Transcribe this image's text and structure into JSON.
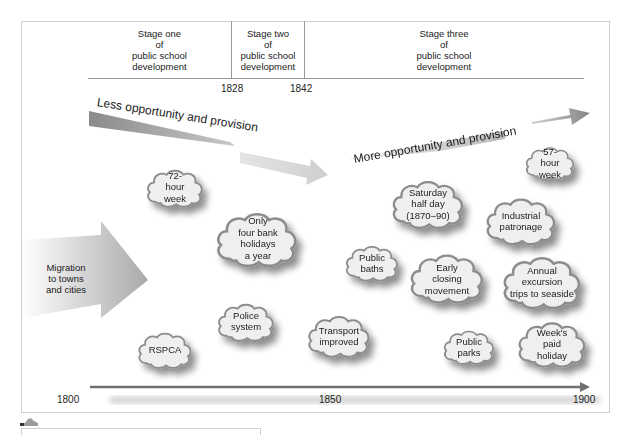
{
  "stages": [
    {
      "label": "Stage one of public school development",
      "lines": [
        "Stage one",
        "of",
        "public school",
        "development"
      ]
    },
    {
      "label": "Stage two of public school development",
      "lines": [
        "Stage two",
        "of",
        "public school",
        "development"
      ]
    },
    {
      "label": "Stage three of public school development",
      "lines": [
        "Stage three",
        "of",
        "public school",
        "development"
      ]
    }
  ],
  "stage_boundaries": [
    "1828",
    "1842"
  ],
  "trend_labels": {
    "less": "Less opportunity and provision",
    "more": "More opportunity and provision"
  },
  "migration": {
    "lines": [
      "Migration",
      "to towns",
      "and cities"
    ]
  },
  "clouds": [
    {
      "id": "72-hour-week",
      "lines": [
        "72-",
        "hour",
        "week"
      ]
    },
    {
      "id": "only-four-bank-holidays",
      "lines": [
        "Only",
        "four bank",
        "holidays",
        "a year"
      ]
    },
    {
      "id": "rspca",
      "lines": [
        "RSPCA"
      ]
    },
    {
      "id": "police-system",
      "lines": [
        "Police",
        "system"
      ]
    },
    {
      "id": "transport-improved",
      "lines": [
        "Transport",
        "improved"
      ]
    },
    {
      "id": "public-baths",
      "lines": [
        "Public",
        "baths"
      ]
    },
    {
      "id": "saturday-half-day",
      "lines": [
        "Saturday",
        "half day",
        "(1870–90)"
      ]
    },
    {
      "id": "early-closing-movement",
      "lines": [
        "Early",
        "closing",
        "movement"
      ]
    },
    {
      "id": "public-parks",
      "lines": [
        "Public",
        "parks"
      ]
    },
    {
      "id": "57-hour-week",
      "lines": [
        "57-",
        "hour",
        "week"
      ]
    },
    {
      "id": "industrial-patronage",
      "lines": [
        "Industrial",
        "patronage"
      ]
    },
    {
      "id": "annual-excursion",
      "lines": [
        "Annual",
        "excursion",
        "trips to seaside"
      ]
    },
    {
      "id": "weeks-paid-holiday",
      "lines": [
        "Week's",
        "paid",
        "holiday"
      ]
    }
  ],
  "timeline": {
    "start": "1800",
    "mid": "1850",
    "end": "1900"
  },
  "colors": {
    "arrow_dark": "#8a8a8a",
    "arrow_light": "#d4d4d4",
    "cloud_fill": "#eeeeee",
    "cloud_stroke": "#8c8c8c",
    "frame": "#cfcfcf",
    "timeline": "#707070"
  }
}
